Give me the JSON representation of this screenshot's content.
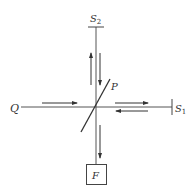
{
  "diagram": {
    "type": "optical-setup",
    "colors": {
      "line": "#555555",
      "arrow": "#333333",
      "text": "#333333"
    },
    "labels": {
      "source": "Q",
      "plate": "P",
      "mirror1_main": "S",
      "mirror1_sub": "1",
      "mirror2_main": "S",
      "mirror2_sub": "2",
      "detector": "F"
    },
    "nodes": [
      {
        "id": "Q",
        "role": "source",
        "x": 14,
        "y": 107
      },
      {
        "id": "P",
        "role": "beam-splitter",
        "x": 96,
        "y": 107
      },
      {
        "id": "S1",
        "role": "mirror",
        "x": 172,
        "y": 107
      },
      {
        "id": "S2",
        "role": "mirror",
        "x": 96,
        "y": 27
      },
      {
        "id": "F",
        "role": "detector-box",
        "x": 96,
        "y": 174
      }
    ],
    "edges": [
      {
        "from": "Q",
        "to": "P",
        "direction": "right"
      },
      {
        "from": "P",
        "to": "S1",
        "direction": "right"
      },
      {
        "from": "S1",
        "to": "P",
        "direction": "left"
      },
      {
        "from": "P",
        "to": "S2",
        "direction": "up"
      },
      {
        "from": "S2",
        "to": "P",
        "direction": "down"
      },
      {
        "from": "P",
        "to": "F",
        "direction": "down"
      }
    ]
  }
}
